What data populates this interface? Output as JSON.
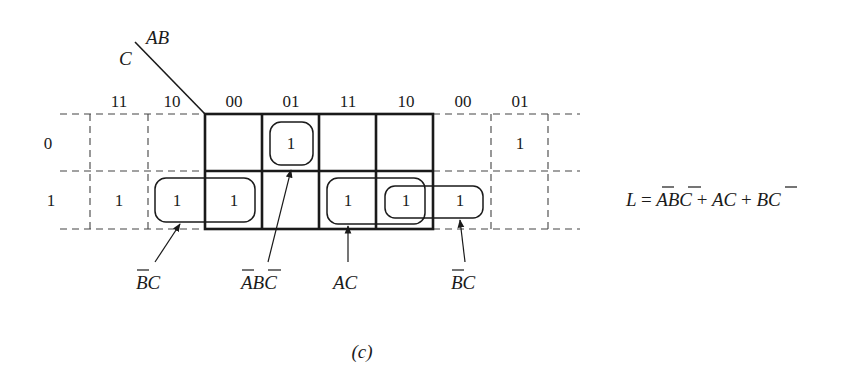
{
  "figure": {
    "caption": "(c)",
    "axis_labels": {
      "row_var": "C",
      "col_vars": "AB"
    },
    "column_headers": [
      "11",
      "10",
      "00",
      "01",
      "11",
      "10",
      "00",
      "01"
    ],
    "main_column_headers": [
      "00",
      "01",
      "11",
      "10"
    ],
    "row_headers": [
      "0",
      "1"
    ],
    "cells": {
      "row0": [
        "",
        "",
        "",
        "1",
        "",
        "",
        "",
        "1"
      ],
      "row1": [
        "1",
        "1",
        "1",
        "",
        "1",
        "1",
        "1",
        ""
      ]
    },
    "groups": [
      {
        "label_main": "BC",
        "label_bar": "B",
        "label_rest": "C",
        "desc": "B-bar C (wrap-around left)"
      },
      {
        "label_main": "ABC",
        "label_bar_a": "A",
        "label_mid": "B",
        "label_bar_c": "C",
        "desc": "A-bar B C-bar"
      },
      {
        "label_main": "AC",
        "desc": "A C"
      },
      {
        "label_main": "BC",
        "label_bar": "B",
        "label_rest": "C",
        "desc": "B-bar C (wrap-around right)"
      }
    ],
    "equation": {
      "lhs": "L",
      "equals": "=",
      "term1_a": "A",
      "term1_b": "B",
      "term1_c": "C",
      "plus": "+",
      "term2": "AC",
      "term3_b": "B",
      "term3_c": "C"
    }
  }
}
